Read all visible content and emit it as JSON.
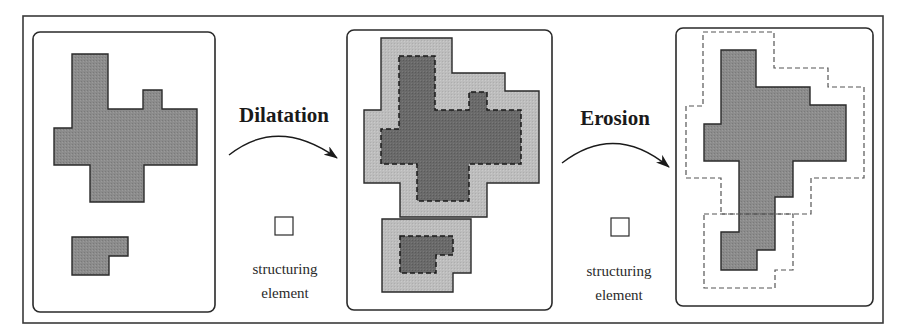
{
  "figure": {
    "colors": {
      "background": "#ffffff",
      "frame": "#3a3a3a",
      "original_fill": "#8c8c8c",
      "dilated_fill": "#bdbdbd",
      "dilated_core_fill": "#6a6a6a",
      "eroded_fill": "#8c8c8c",
      "outline": "#2a2a2a",
      "dashed_outline": "#555555"
    },
    "panels": [
      {
        "id": "original",
        "label": "original image"
      },
      {
        "id": "dilated",
        "label": "dilated image"
      },
      {
        "id": "eroded",
        "label": "eroded image"
      }
    ],
    "operations": [
      {
        "name": "Dilatation",
        "structuring_element_line1": "structuring",
        "structuring_element_line2": "element"
      },
      {
        "name": "Erosion",
        "structuring_element_line1": "structuring",
        "structuring_element_line2": "element"
      }
    ]
  }
}
